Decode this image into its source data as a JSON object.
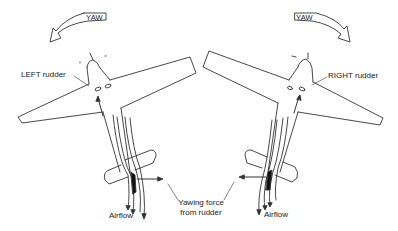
{
  "diagram": {
    "left_panel": {
      "yaw_label": "YAW",
      "rudder_label": "LEFT rudder",
      "airflow_label": "Airflow",
      "yaw_direction": "left"
    },
    "right_panel": {
      "yaw_label": "YAW",
      "rudder_label": "RIGHT rudder",
      "airflow_label": "Airflow",
      "yaw_direction": "right"
    },
    "shared_label": {
      "line1": "Yawing force",
      "line2": "from rudder"
    },
    "colors": {
      "line": "#333333",
      "background": "#ffffff"
    }
  }
}
